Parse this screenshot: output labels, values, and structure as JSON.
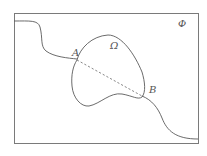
{
  "diagram": {
    "frame_label": "Φ",
    "region_label": "Ω",
    "point_a_label": "A",
    "point_b_label": "B",
    "colors": {
      "stroke": "#5a5a5a",
      "frame": "#7a7a7a",
      "background": "#ffffff"
    }
  }
}
